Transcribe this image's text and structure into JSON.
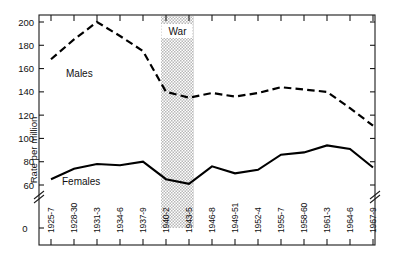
{
  "chart_data": {
    "type": "line",
    "title": "",
    "xlabel": "",
    "ylabel": "Rate per million",
    "ylim": [
      55,
      207
    ],
    "yticks": [
      60,
      80,
      100,
      120,
      140,
      160,
      180,
      200
    ],
    "ytick_labels": [
      "60",
      "80",
      "100",
      "120",
      "140",
      "160",
      "180",
      "200"
    ],
    "y_zero_label": "0",
    "y_axis_break": true,
    "grid": false,
    "legend": "inline-labels",
    "categories": [
      "1925-7",
      "1928-30",
      "1931-3",
      "1934-6",
      "1937-9",
      "1940-2",
      "1943-5",
      "1946-8",
      "1949-51",
      "1952-4",
      "1955-7",
      "1958-60",
      "1961-3",
      "1964-6",
      "1967-9"
    ],
    "series": [
      {
        "name": "Males",
        "style": "dashed",
        "color": "#000000",
        "values": [
          168,
          185,
          200,
          188,
          175,
          140,
          135,
          139,
          136,
          139,
          144,
          142,
          140,
          126,
          111
        ]
      },
      {
        "name": "Females",
        "style": "solid",
        "color": "#000000",
        "values": [
          65,
          74,
          78,
          77,
          80,
          65,
          61,
          76,
          70,
          73,
          86,
          88,
          94,
          91,
          75
        ]
      }
    ],
    "annotations": [
      {
        "name": "war-shaded-region",
        "label": "War",
        "type": "vertical-band",
        "start_category": "1937-9",
        "end_category": "1946-8",
        "fill": "#c9c9c9",
        "pattern": "dotted-stipple"
      }
    ],
    "series_inline_labels": [
      {
        "name": "Males",
        "text": "Males"
      },
      {
        "name": "Females",
        "text": "Females"
      }
    ]
  },
  "frame": {
    "border_color": "#1a1a1a",
    "background": "#ffffff"
  }
}
